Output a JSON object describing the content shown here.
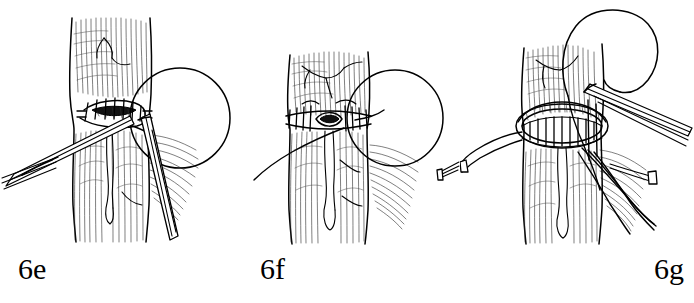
{
  "figure": {
    "background_color": "#ffffff",
    "ink_color": "#000000",
    "style": "pen-and-ink medical line drawing",
    "panel_count": 3
  },
  "panels": [
    {
      "id": "6e",
      "label": "6e",
      "caption_position": "bottom-left",
      "subject": "tubular organ anastomosis with interrupted sutures being placed",
      "elements": [
        "vertical tubular tissue segment with longitudinal hatching",
        "transverse anastomosis line with interrupted sutures",
        "open circular suture loop at upper right",
        "needle holder entering from lower left",
        "forceps entering from lower right",
        "posterior rib-like hatched tissue at right"
      ]
    },
    {
      "id": "6f",
      "label": "6f",
      "caption_position": "bottom-left",
      "subject": "completed transverse suture line with small residual opening",
      "elements": [
        "vertical tubular tissue segment with longitudinal hatching",
        "continuous row of interrupted sutures across the circumference",
        "dark lens-shaped residual lumen opening at centre",
        "open circular suture loop at upper right",
        "long suture thread trailing to lower left",
        "small instrument tip at right margin",
        "posterior rib-like hatched tissue at right"
      ]
    },
    {
      "id": "6g",
      "label": "6g",
      "caption_position": "bottom-right",
      "subject": "widely opened anastomotic ring held by traction sutures and instruments",
      "elements": [
        "vertical tubular tissue segment with longitudinal hatching",
        "elliptical opened anastomosis ring with sutures across it",
        "large suture loop arching above the field",
        "forceps entering from upper right",
        "traction suture pulled to the left",
        "multiple suture strands drawn to the lower right",
        "posterior rib-like hatched tissue at right"
      ]
    }
  ],
  "labels": {
    "panel_e": "6e",
    "panel_f": "6f",
    "panel_g": "6g"
  }
}
